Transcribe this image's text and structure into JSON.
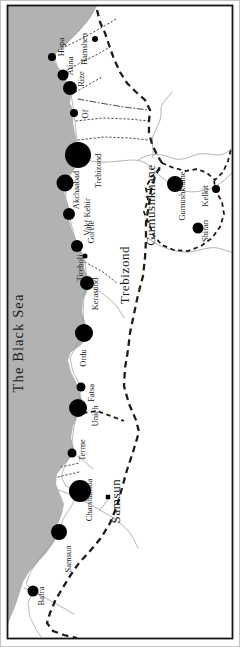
{
  "map": {
    "sea": {
      "label": "The Black Sea"
    },
    "regions": [
      {
        "name": "Trebizond"
      },
      {
        "name": "Gumushkhane"
      },
      {
        "name": "Samsun"
      }
    ],
    "cities": [
      {
        "name": "Hopa",
        "x": 52,
        "y": 57,
        "r": 4,
        "lx": 64,
        "ly": 47
      },
      {
        "name": "Atina",
        "x": 63,
        "y": 75,
        "r": 5.5,
        "lx": 73,
        "ly": 66
      },
      {
        "name": "Rize",
        "x": 70,
        "y": 88,
        "r": 7,
        "lx": 84,
        "ly": 79
      },
      {
        "name": "Hamshen",
        "x": 95,
        "y": 39,
        "r": 3,
        "lx": 87,
        "ly": 49
      },
      {
        "name": "Of",
        "x": 74,
        "y": 113,
        "r": 4,
        "lx": 88,
        "ly": 114
      },
      {
        "name": "Trebizond",
        "x": 78,
        "y": 155,
        "r": 13,
        "lx": 101,
        "ly": 171
      },
      {
        "name": "Akchaabad",
        "x": 65,
        "y": 183,
        "r": 8.5,
        "lx": 79,
        "ly": 190
      },
      {
        "name": "Vakf Kebir",
        "x": 69,
        "y": 214,
        "r": 6,
        "lx": 90,
        "ly": 217
      },
      {
        "name": "Gorele",
        "x": 77,
        "y": 246,
        "r": 6,
        "lx": 94,
        "ly": 232
      },
      {
        "name": "Tireboli",
        "x": 85,
        "y": 256,
        "r": 2.5,
        "lx": 83,
        "ly": 268
      },
      {
        "name": "Kerasund",
        "x": 87,
        "y": 283,
        "r": 7,
        "lx": 98,
        "ly": 294
      },
      {
        "name": "Ordu",
        "x": 84,
        "y": 333,
        "r": 9,
        "lx": 86,
        "ly": 358
      },
      {
        "name": "Fatsa",
        "x": 81,
        "y": 387,
        "r": 4.5,
        "lx": 94,
        "ly": 393
      },
      {
        "name": "Unieh",
        "x": 78,
        "y": 408,
        "r": 9,
        "lx": 98,
        "ly": 416
      },
      {
        "name": "Terme",
        "x": 72,
        "y": 453,
        "r": 4.5,
        "lx": 85,
        "ly": 450
      },
      {
        "name": "Charshamba",
        "x": 80,
        "y": 491,
        "r": 11,
        "lx": 92,
        "ly": 500
      },
      {
        "name": "Samsun",
        "x": 59,
        "y": 532,
        "r": 8,
        "lx": 71,
        "ly": 559
      },
      {
        "name": "Bafra",
        "x": 33,
        "y": 591,
        "r": 5.5,
        "lx": 44,
        "ly": 596
      },
      {
        "name": "Gumushkhane",
        "x": 175,
        "y": 184,
        "r": 8,
        "lx": 185,
        "ly": 196
      },
      {
        "name": "Kelkit",
        "x": 216,
        "y": 189,
        "r": 4,
        "lx": 208,
        "ly": 196
      },
      {
        "name": "Shiran",
        "x": 198,
        "y": 228,
        "r": 5.5,
        "lx": 208,
        "ly": 231
      },
      {
        "name": "",
        "x": 108,
        "y": 497,
        "r": 2.2,
        "shape": "square"
      }
    ]
  },
  "colors": {
    "sea": "#b2b2b2",
    "land": "#ffffff",
    "marker": "#000000",
    "text": "#1c1c1c",
    "boundary": "#1d1d1d",
    "river": "#9a9a9a",
    "frame": "#141414",
    "outer_edge": "#c4c4c4"
  }
}
